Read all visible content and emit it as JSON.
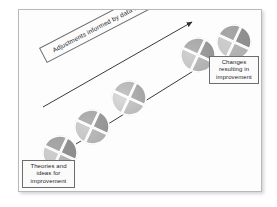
{
  "diagram": {
    "frame": {
      "border_color": "#b9b9b9",
      "background": "#fdfdfd"
    },
    "banner": {
      "text": "Adjustments informed by data and learning",
      "rotation_deg": -27.5,
      "border_color": "#6d6d6d"
    },
    "labels": {
      "start": {
        "lines": [
          "Theories and",
          "ideas for",
          "improvement"
        ],
        "text": "Theories and ideas for improvement"
      },
      "end": {
        "lines": [
          "Changes",
          "resulting in",
          "improvement"
        ],
        "text": "Changes resulting in improvement"
      }
    },
    "arrows": {
      "color": "#3a3a3a",
      "upper": {
        "x1": 24,
        "y1": 97,
        "x2": 173,
        "y2": 12
      },
      "lower": {
        "x1": 57,
        "y1": 134,
        "x2": 192,
        "y2": 50
      }
    },
    "wheels": [
      {
        "name": "pdsa-cycle-1",
        "cx": 41,
        "cy": 143,
        "r": 17,
        "shade": "dark"
      },
      {
        "name": "pdsa-cycle-2",
        "cx": 73,
        "cy": 117,
        "r": 17,
        "shade": "mid"
      },
      {
        "name": "pdsa-cycle-3",
        "cx": 110,
        "cy": 88,
        "r": 17,
        "shade": "light"
      },
      {
        "name": "pdsa-cycle-4",
        "cx": 179,
        "cy": 45,
        "r": 17,
        "shade": "mid"
      },
      {
        "name": "pdsa-cycle-5",
        "cx": 215,
        "cy": 32,
        "r": 17,
        "shade": "dark"
      }
    ],
    "wheel_colors": {
      "quadrant_a": "#8d8d8d",
      "quadrant_b": "#b6b6b6",
      "quadrant_c": "#cfcfcf",
      "quadrant_d": "#a3a3a3",
      "divider": "#ffffff",
      "outline": "#9a9a9a"
    }
  }
}
